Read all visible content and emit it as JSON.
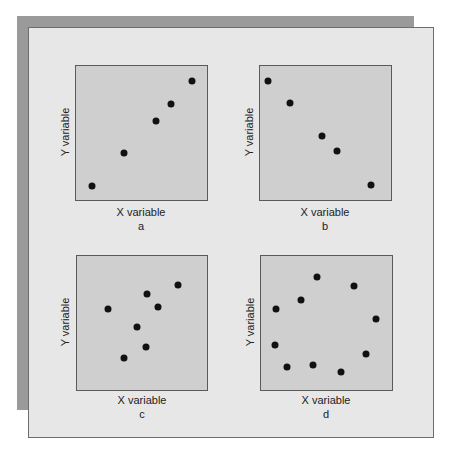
{
  "figure": {
    "panels": [
      {
        "id": "a",
        "xlabel": "X variable",
        "ylabel": "Y variable",
        "sublabel": "a"
      },
      {
        "id": "b",
        "xlabel": "X variable",
        "ylabel": "Y variable",
        "sublabel": "b"
      },
      {
        "id": "c",
        "xlabel": "X variable",
        "ylabel": "Y variable",
        "sublabel": "c"
      },
      {
        "id": "d",
        "xlabel": "X variable",
        "ylabel": "Y variable",
        "sublabel": "d"
      }
    ],
    "colors": {
      "plot_bg": "#cfcfcf",
      "panel_bg": "#e7e7e7",
      "shadow": "#9a9a9a",
      "dot": "#111111"
    }
  },
  "chart_data": [
    {
      "type": "scatter",
      "title": "a",
      "xlabel": "X variable",
      "ylabel": "Y variable",
      "grid": false,
      "points": [
        [
          0.13,
          0.11
        ],
        [
          0.37,
          0.35
        ],
        [
          0.61,
          0.59
        ],
        [
          0.72,
          0.71
        ],
        [
          0.88,
          0.88
        ]
      ]
    },
    {
      "type": "scatter",
      "title": "b",
      "xlabel": "X variable",
      "ylabel": "Y variable",
      "grid": false,
      "points": [
        [
          0.07,
          0.88
        ],
        [
          0.23,
          0.72
        ],
        [
          0.47,
          0.48
        ],
        [
          0.59,
          0.37
        ],
        [
          0.84,
          0.12
        ]
      ]
    },
    {
      "type": "scatter",
      "title": "c",
      "xlabel": "X variable",
      "ylabel": "Y variable",
      "grid": false,
      "points": [
        [
          0.24,
          0.6
        ],
        [
          0.54,
          0.71
        ],
        [
          0.62,
          0.62
        ],
        [
          0.77,
          0.78
        ],
        [
          0.46,
          0.47
        ],
        [
          0.53,
          0.32
        ],
        [
          0.36,
          0.24
        ]
      ]
    },
    {
      "type": "scatter",
      "title": "d",
      "xlabel": "X variable",
      "ylabel": "Y variable",
      "grid": false,
      "points": [
        [
          0.43,
          0.84
        ],
        [
          0.71,
          0.77
        ],
        [
          0.31,
          0.67
        ],
        [
          0.12,
          0.6
        ],
        [
          0.87,
          0.53
        ],
        [
          0.11,
          0.34
        ],
        [
          0.8,
          0.27
        ],
        [
          0.2,
          0.18
        ],
        [
          0.4,
          0.19
        ],
        [
          0.61,
          0.14
        ]
      ]
    }
  ]
}
